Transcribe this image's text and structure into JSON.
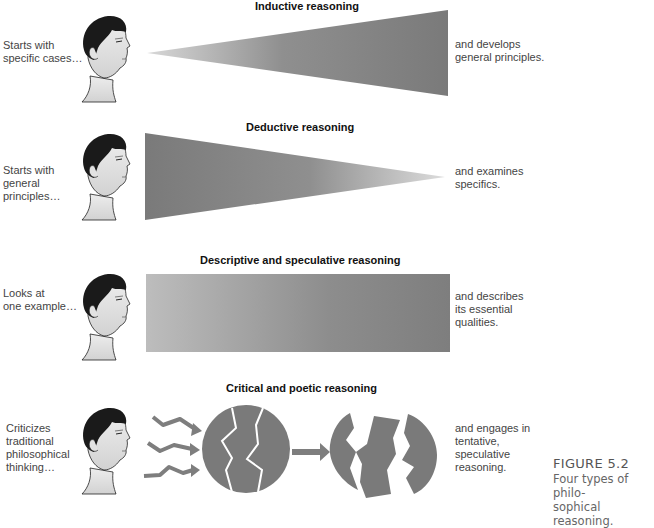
{
  "figure": {
    "caption": {
      "number": "FIGURE 5.2",
      "text": "Four types of philo-\nsophical reasoning."
    },
    "colors": {
      "shape_dark": "#7a7a7a",
      "shape_light": "#cfcfcf",
      "hair": "#1a1a1a",
      "skin": "#e6e6e6"
    }
  },
  "panels": [
    {
      "title": "Inductive reasoning",
      "left_text": "Starts with\nspecific cases…",
      "right_text": "and develops\ngeneral principles.",
      "shape": "expanding-triangle"
    },
    {
      "title": "Deductive reasoning",
      "left_text": "Starts with\ngeneral\nprinciples…",
      "right_text": "and examines\nspecifics.",
      "shape": "narrowing-triangle"
    },
    {
      "title": "Descriptive and speculative reasoning",
      "left_text": "Looks at\none example…",
      "right_text": "and describes\nits essential\nqualities.",
      "shape": "rectangle"
    },
    {
      "title": "Critical and poetic reasoning",
      "left_text": "Criticizes\ntraditional\nphilosophical\nthinking…",
      "right_text": "and engages in\ntentative,\nspeculative\nreasoning.",
      "shape": "cracked-circle-to-fragments"
    }
  ]
}
